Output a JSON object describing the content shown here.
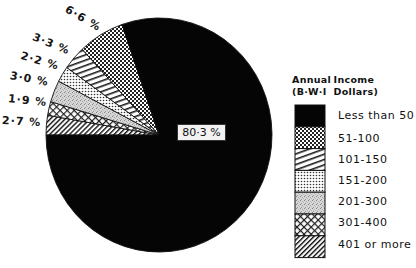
{
  "chart_data": {
    "type": "pie",
    "title": "",
    "legend_title": [
      "Annual  Income",
      "(B·W·I  Dollars)"
    ],
    "legend_position": "right",
    "start_angle_deg": 180,
    "direction": "clockwise",
    "slices": [
      {
        "category": "401 or more",
        "value": 2.7,
        "label": "2·7 %",
        "pattern": "diag-right-dense"
      },
      {
        "category": "301-400",
        "value": 1.9,
        "label": "1·9 %",
        "pattern": "checks"
      },
      {
        "category": "201-300",
        "value": 3.0,
        "label": "3·0 %",
        "pattern": "stipple"
      },
      {
        "category": "151-200",
        "value": 2.2,
        "label": "2·2 %",
        "pattern": "dots"
      },
      {
        "category": "101-150",
        "value": 3.3,
        "label": "3·3 %",
        "pattern": "diag-left"
      },
      {
        "category": "51-100",
        "value": 6.6,
        "label": "6·6 %",
        "pattern": "dense-checks"
      },
      {
        "category": "Less than 50",
        "value": 80.3,
        "label": "80·3 %",
        "pattern": "solid-black"
      }
    ],
    "legend_entries": [
      "Less than 50",
      "51-100",
      "101-150",
      "151-200",
      "201-300",
      "301-400",
      "401 or more"
    ]
  },
  "labels": {
    "center": "80·3 %",
    "outer": {
      "l66": "6·6 %",
      "l33": "3·3 %",
      "l22": "2·2 %",
      "l30": "3·0 %",
      "l19": "1·9 %",
      "l27": "2·7 %"
    }
  },
  "legend": {
    "title_line1_a": "Annual",
    "title_line1_b": "Income",
    "title_line2_a": "(B·W·I",
    "title_line2_b": "Dollars)",
    "items": [
      "Less than 50",
      "51-100",
      "101-150",
      "151-200",
      "201-300",
      "301-400",
      "401 or more"
    ]
  }
}
